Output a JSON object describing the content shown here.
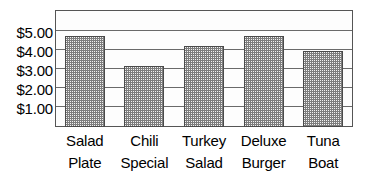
{
  "chart_data": {
    "type": "bar",
    "title": "",
    "xlabel": "",
    "ylabel": "",
    "categories": [
      "Salad Plate",
      "Chili Special",
      "Turkey Salad",
      "Deluxe Burger",
      "Tuna Boat"
    ],
    "category_lines": [
      [
        "Salad",
        "Plate"
      ],
      [
        "Chili",
        "Special"
      ],
      [
        "Turkey",
        "Salad"
      ],
      [
        "Deluxe",
        "Burger"
      ],
      [
        "Tuna",
        "Boat"
      ]
    ],
    "values": [
      4.8,
      3.2,
      4.25,
      4.8,
      4.0
    ],
    "ylim": [
      0,
      6.15
    ],
    "yticks": [
      1,
      2,
      3,
      4,
      5
    ],
    "ytick_labels": [
      "$1.00",
      "$2.00",
      "$3.00",
      "$4.00",
      "$5.00"
    ],
    "grid": true,
    "legend": false,
    "bar_fill": "halftone-checker-gray",
    "colors": {
      "background": "#ffffff",
      "plot_background": "#fdfdfd",
      "bar_fill": "#7d7d7d",
      "bar_edge": "#4a4a4a",
      "gridline": "#6a6a6a",
      "frame": "#555555",
      "text": "#000000"
    }
  }
}
